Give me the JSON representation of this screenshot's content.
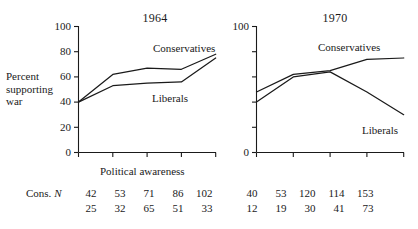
{
  "figure": {
    "y_axis_label_lines": [
      "Percent",
      "supporting",
      "war"
    ],
    "x_axis_label": "Political awareness"
  },
  "chart_data": [
    {
      "type": "line",
      "title": "1964",
      "xlabel": "Political awareness",
      "ylabel": "Percent supporting war",
      "ylim": [
        0,
        100
      ],
      "yticks": [
        0,
        20,
        40,
        60,
        80,
        100
      ],
      "ytick_labels": [
        "0",
        "20",
        "40",
        "60",
        "80",
        "100"
      ],
      "x": [
        1,
        2,
        3,
        4,
        5
      ],
      "xtick_labels": [
        "",
        "",
        "",
        "",
        ""
      ],
      "grid": false,
      "legend": "inline-annotations",
      "series": [
        {
          "name": "Conservatives",
          "values": [
            40,
            62,
            67,
            66,
            78
          ]
        },
        {
          "name": "Liberals",
          "values": [
            40,
            53,
            55,
            56,
            75
          ]
        }
      ]
    },
    {
      "type": "line",
      "title": "1970",
      "xlabel": "Political awareness",
      "ylabel": "Percent supporting war",
      "ylim": [
        0,
        100
      ],
      "yticks": [
        0,
        20,
        40,
        60,
        80,
        100
      ],
      "ytick_labels": [
        "0",
        "",
        "",
        "",
        "",
        "100"
      ],
      "x": [
        1,
        2,
        3,
        4,
        5
      ],
      "xtick_labels": [
        "",
        "",
        "",
        "",
        ""
      ],
      "grid": false,
      "legend": "inline-annotations",
      "series": [
        {
          "name": "Conservatives",
          "values": [
            48,
            62,
            65,
            74,
            75
          ]
        },
        {
          "name": "Liberals",
          "values": [
            40,
            60,
            64,
            48,
            30
          ]
        }
      ]
    }
  ],
  "n_table": {
    "row_header": {
      "prefix": "Cons.",
      "symbol": "N"
    },
    "rows": [
      {
        "label": "Cons. N",
        "panel_1964": [
          "42",
          "53",
          "71",
          "86",
          "102"
        ],
        "panel_1970": [
          "40",
          "53",
          "120",
          "114",
          "153"
        ]
      },
      {
        "label": "",
        "panel_1964": [
          "25",
          "32",
          "65",
          "51",
          "33"
        ],
        "panel_1970": [
          "12",
          "19",
          "30",
          "41",
          "73"
        ]
      }
    ]
  },
  "panels": {
    "left": {
      "title": "1964",
      "ytick_labels": [
        "100",
        "80",
        "60",
        "40",
        "20",
        "0"
      ],
      "series_labels": {
        "conservatives": "Conservatives",
        "liberals": "Liberals"
      }
    },
    "right": {
      "title": "1970",
      "ytick_labels": [
        "100",
        "0"
      ],
      "series_labels": {
        "conservatives": "Conservatives",
        "liberals": "Liberals"
      }
    }
  }
}
